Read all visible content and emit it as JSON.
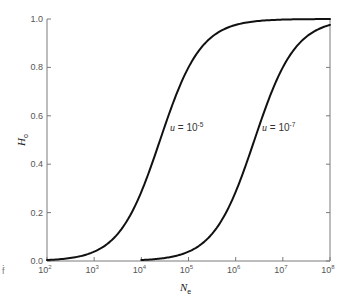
{
  "chart_data": {
    "type": "line",
    "title": "",
    "xlabel": "N",
    "xlabel_subscript": "e",
    "ylabel": "H",
    "ylabel_subscript": "o",
    "xscale": "log",
    "xlim": [
      100,
      100000000
    ],
    "ylim": [
      0.0,
      1.0
    ],
    "x_ticks": [
      100,
      1000,
      10000,
      100000,
      1000000,
      10000000,
      100000000
    ],
    "x_tick_labels": [
      {
        "base": "10",
        "exp": "2"
      },
      {
        "base": "10",
        "exp": "3"
      },
      {
        "base": "10",
        "exp": "4"
      },
      {
        "base": "10",
        "exp": "5"
      },
      {
        "base": "10",
        "exp": "6"
      },
      {
        "base": "10",
        "exp": "7"
      },
      {
        "base": "10",
        "exp": "8"
      }
    ],
    "y_ticks": [
      0.0,
      0.2,
      0.4,
      0.6,
      0.8,
      1.0
    ],
    "y_tick_labels": [
      "0.0",
      "0.2",
      "0.4",
      "0.6",
      "0.8",
      "1.0"
    ],
    "grid": false,
    "legend": "none (inline annotations)",
    "series": [
      {
        "name": "u = 10^-5",
        "label_text": "u = 10",
        "label_exp": "-5",
        "x": [
          100,
          316,
          1000,
          3162,
          10000,
          25000,
          31623,
          100000,
          316228,
          1000000,
          10000000,
          100000000
        ],
        "values": [
          0.004,
          0.012,
          0.038,
          0.112,
          0.286,
          0.5,
          0.558,
          0.8,
          0.927,
          0.976,
          0.998,
          1.0
        ]
      },
      {
        "name": "u = 10^-7",
        "label_text": "u = 10",
        "label_exp": "-7",
        "x": [
          10000,
          31623,
          100000,
          316228,
          1000000,
          2500000,
          3162278,
          10000000,
          31622777,
          100000000
        ],
        "values": [
          0.004,
          0.012,
          0.038,
          0.112,
          0.286,
          0.5,
          0.558,
          0.8,
          0.927,
          0.976
        ]
      }
    ],
    "annotations": [
      {
        "text": "u = 10^-5",
        "near_x": 25000,
        "near_y": 0.55
      },
      {
        "text": "u = 10^-7",
        "near_x": 2500000,
        "near_y": 0.55
      }
    ]
  },
  "edge_artifacts": [
    ".",
    "f"
  ]
}
